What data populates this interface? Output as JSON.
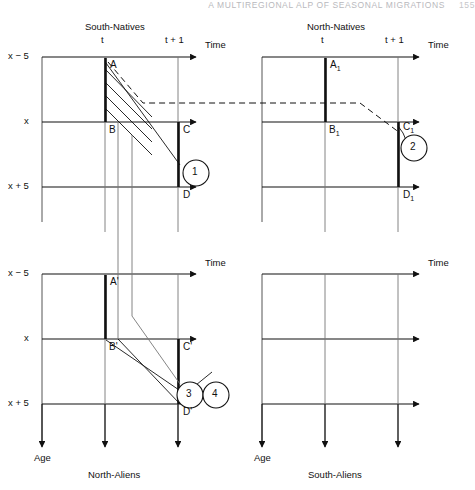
{
  "page_header": {
    "running_head": "A MULTIREGIONAL ALP OF SEASONAL MIGRATIONS",
    "page_number": "155"
  },
  "figure": {
    "axis_labels": {
      "time": "Time",
      "age": "Age"
    },
    "age_ticks": [
      "x − 5",
      "x",
      "x + 5"
    ],
    "time_ticks": [
      "t",
      "t + 1"
    ],
    "panels": [
      {
        "id": "south-natives",
        "title": "South-Natives",
        "position": "top-left",
        "points": [
          "A",
          "B",
          "C",
          "D"
        ],
        "callouts": [
          "1"
        ],
        "has_dashed_transfer": true,
        "has_cohort_band": true
      },
      {
        "id": "north-natives",
        "title": "North-Natives",
        "position": "top-right",
        "points": [
          "A1",
          "B1",
          "C1",
          "D1"
        ],
        "point_labels": [
          "A",
          "B",
          "C",
          "D"
        ],
        "point_subscripts": [
          "1",
          "1",
          "1",
          "1"
        ],
        "callouts": [
          "2"
        ],
        "has_dashed_transfer": true,
        "has_cohort_band": false
      },
      {
        "id": "north-aliens",
        "title": "North-Aliens",
        "position": "bottom-left",
        "points": [
          "A'",
          "B'",
          "C'",
          "D'"
        ],
        "callouts": [
          "3",
          "4"
        ],
        "has_dashed_transfer": false,
        "has_cohort_band": false
      },
      {
        "id": "south-aliens",
        "title": "South-Aliens",
        "position": "bottom-right",
        "points": [],
        "callouts": [],
        "has_dashed_transfer": false,
        "has_cohort_band": false
      }
    ],
    "colors": {
      "line": "#111111",
      "grid": "#555555",
      "background": "#ffffff",
      "header_text": "#b9b9bd"
    }
  }
}
